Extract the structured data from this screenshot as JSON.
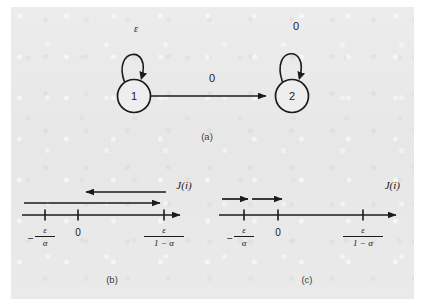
{
  "figure": {
    "background_color": "#e9e9e9",
    "ink_color": "#1b1b1b"
  },
  "panel_a": {
    "caption": "(a)",
    "states": [
      {
        "id": "state-1",
        "label": "1",
        "cx": 134,
        "cy": 96,
        "r": 16.5
      },
      {
        "id": "state-2",
        "label": "2",
        "cx": 292,
        "cy": 96,
        "r": 16.5
      }
    ],
    "transitions": [
      {
        "name": "self-loop-state-1",
        "from": "1",
        "to": "1",
        "label": "ε",
        "label_x": 136,
        "label_y": 32
      },
      {
        "name": "transition-1-to-2",
        "from": "1",
        "to": "2",
        "label": "0",
        "label_x": 212,
        "label_y": 82
      },
      {
        "name": "self-loop-state-2",
        "from": "2",
        "to": "2",
        "label": "0",
        "label_x": 296,
        "label_y": 30
      }
    ]
  },
  "panel_b": {
    "caption": "(b)",
    "axis_title": "J(i)",
    "axis": {
      "x_start": 22,
      "x_end": 184,
      "y": 215
    },
    "ticks": [
      {
        "name": "tick-neg-eps-over-alpha",
        "x": 45,
        "label_kind": "fraction",
        "numerator": "ε",
        "denominator": "α",
        "sign": "−"
      },
      {
        "name": "tick-zero",
        "x": 78,
        "label_kind": "plain",
        "label": "0"
      },
      {
        "name": "tick-eps-over-one-minus-alpha",
        "x": 164,
        "label_kind": "fraction",
        "numerator": "ε",
        "denominator": "1 − α",
        "sign": ""
      }
    ],
    "arrows": [
      {
        "name": "arrow-leftward",
        "x_from": 166,
        "x_to": 80,
        "y": 192,
        "direction": "left"
      },
      {
        "name": "arrow-rightward",
        "x_from": 24,
        "x_to": 166,
        "y": 203,
        "direction": "right"
      }
    ]
  },
  "panel_c": {
    "caption": "(c)",
    "axis_title": "J(i)",
    "axis": {
      "x_start": 219,
      "x_end": 400,
      "y": 215
    },
    "ticks": [
      {
        "name": "tick-neg-eps-over-alpha",
        "x": 244,
        "label_kind": "fraction",
        "numerator": "ε",
        "denominator": "α",
        "sign": "−"
      },
      {
        "name": "tick-zero",
        "x": 278,
        "label_kind": "plain",
        "label": "0"
      },
      {
        "name": "tick-eps-over-one-minus-alpha",
        "x": 363,
        "label_kind": "fraction",
        "numerator": "ε",
        "denominator": "1 − α",
        "sign": ""
      }
    ],
    "arrows": [
      {
        "name": "arrow-rightward-inner",
        "x_from": 222,
        "x_to": 252,
        "y": 199,
        "direction": "right"
      },
      {
        "name": "arrow-rightward-outer",
        "x_from": 253,
        "x_to": 286,
        "y": 199,
        "direction": "right"
      }
    ]
  },
  "captions": {
    "a_x": 207,
    "a_y": 140,
    "b_x": 112,
    "b_y": 283,
    "c_x": 307,
    "c_y": 283
  },
  "axis_titles": {
    "b_x": 184,
    "b_y": 189,
    "c_x": 400,
    "c_y": 189
  }
}
